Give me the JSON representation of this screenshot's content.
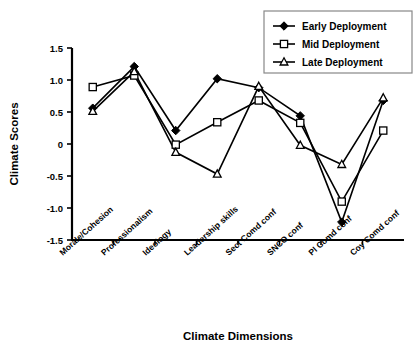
{
  "chart_data": {
    "type": "line",
    "title": "",
    "xlabel": "Climate Dimensions",
    "ylabel": "Climate Scores",
    "categories": [
      "Morale/Cohesion",
      "Professionalism",
      "Ideology",
      "Leadership skills",
      "Sect Comd conf",
      "SNCO conf",
      "Pl Comd conf",
      "Coy Comd conf"
    ],
    "ylim": [
      -1.5,
      1.5
    ],
    "yticks": [
      1.5,
      1.0,
      0.5,
      0,
      -0.5,
      -1.0,
      -1.5
    ],
    "ytick_labels": [
      "1.5",
      "1.0",
      "0.5",
      "0",
      "-0.5",
      "-1.0",
      "-1.5"
    ],
    "grid": false,
    "legend_position": "top-right",
    "series": [
      {
        "name": "Early Deployment",
        "marker": "filled-diamond",
        "values": [
          0.56,
          1.21,
          0.21,
          1.02,
          0.88,
          0.44,
          -1.22,
          0.68
        ]
      },
      {
        "name": "Mid Deployment",
        "marker": "open-square",
        "values": [
          0.89,
          1.07,
          -0.01,
          0.34,
          0.68,
          0.33,
          -0.9,
          0.21
        ]
      },
      {
        "name": "Late Deployment",
        "marker": "open-triangle",
        "values": [
          0.51,
          1.13,
          -0.13,
          -0.47,
          0.9,
          -0.02,
          -0.32,
          0.72
        ]
      }
    ]
  },
  "legend": {
    "items": [
      {
        "label": "Early Deployment"
      },
      {
        "label": "Mid Deployment"
      },
      {
        "label": "Late Deployment"
      }
    ]
  },
  "axes": {
    "y_title": "Climate Scores",
    "x_title": "Climate Dimensions"
  }
}
